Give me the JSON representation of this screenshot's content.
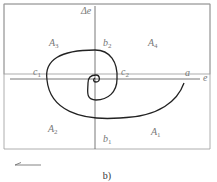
{
  "diagram": {
    "axis_labels": {
      "vertical": "Δe",
      "horizontal": "e"
    },
    "region_labels": [
      {
        "base": "A",
        "sub": "3"
      },
      {
        "base": "A",
        "sub": "4"
      },
      {
        "base": "A",
        "sub": "2"
      },
      {
        "base": "A",
        "sub": "1"
      }
    ],
    "point_labels": {
      "a": "a",
      "b1": {
        "base": "b",
        "sub": "1"
      },
      "b2": {
        "base": "b",
        "sub": "2"
      },
      "c1": {
        "base": "c",
        "sub": "1"
      },
      "c2": {
        "base": "c",
        "sub": "2"
      }
    },
    "direction_arrow": "left",
    "caption": "b)"
  }
}
